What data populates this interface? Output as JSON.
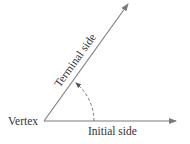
{
  "diagram": {
    "labels": {
      "vertex": "Vertex",
      "initial_side": "Initial side",
      "terminal_side": "Terminal side"
    },
    "colors": {
      "line": "#7a7a7a",
      "text": "#333333",
      "background": "#ffffff"
    },
    "geometry": {
      "vertex": [
        44,
        121
      ],
      "initial_tip": [
        176,
        121
      ],
      "terminal_tip": [
        128,
        4
      ],
      "terminal_angle_deg": 54.4
    }
  }
}
